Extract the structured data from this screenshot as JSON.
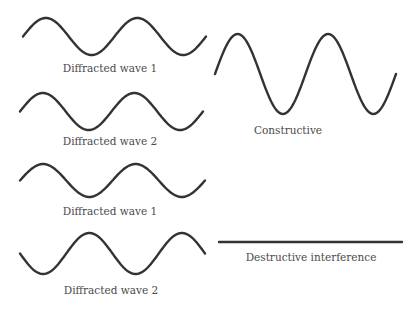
{
  "figure": {
    "stroke_color": "#333333",
    "label_color": "#4a4a4a",
    "background": "#ffffff"
  },
  "panels": [
    {
      "name": "constructive",
      "inputs": [
        {
          "label": "Diffracted wave 1",
          "amplitude": 1,
          "phase_deg": 0
        },
        {
          "label": "Diffracted wave 2",
          "amplitude": 1,
          "phase_deg": 0
        }
      ],
      "result": {
        "label": "Constructive",
        "amplitude": 2,
        "phase_deg": 0
      }
    },
    {
      "name": "destructive",
      "inputs": [
        {
          "label": "Diffracted wave 1",
          "amplitude": 1,
          "phase_deg": 0
        },
        {
          "label": "Diffracted wave 2",
          "amplitude": 1,
          "phase_deg": 180
        }
      ],
      "result": {
        "label": "Destructive interference",
        "amplitude": 0,
        "phase_deg": 0
      }
    }
  ],
  "cycles_shown": 2
}
